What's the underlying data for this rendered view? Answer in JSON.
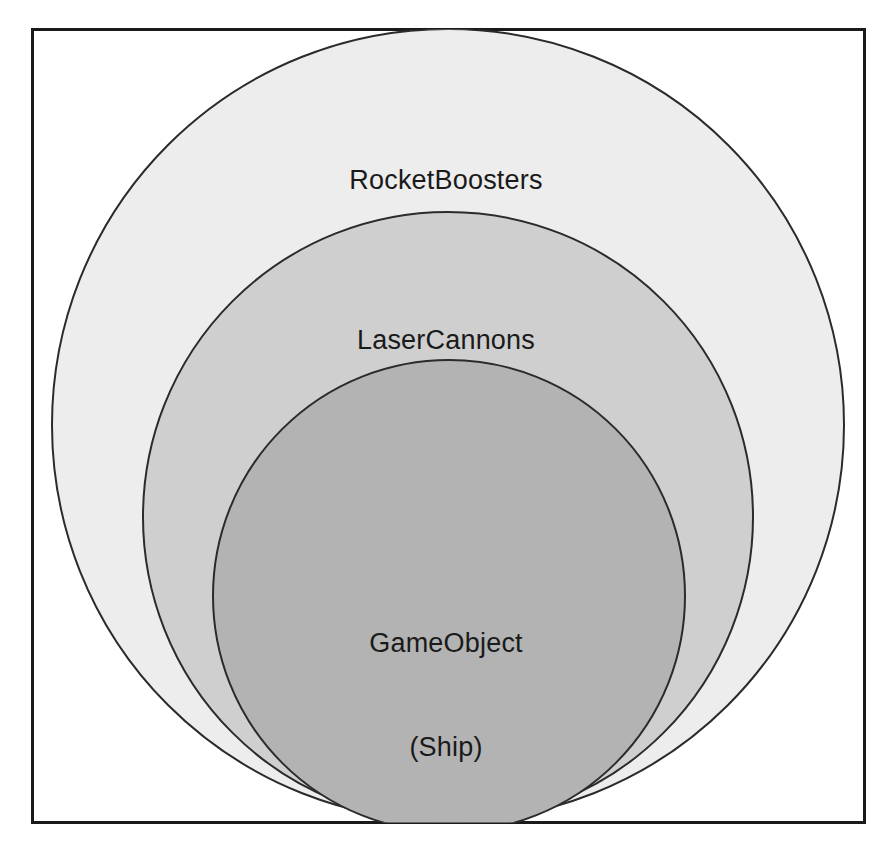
{
  "diagram": {
    "type": "nested-set-diagram",
    "title": "",
    "background_color": "#ffffff",
    "frame": {
      "name": "outer-frame",
      "stroke_color": "#1a1a1a",
      "fill_color": "#ffffff",
      "stroke_width": 3,
      "x": 31,
      "y": 28,
      "width": 835,
      "height": 796
    },
    "circles": [
      {
        "id": "rocketboosters",
        "label": "RocketBoosters",
        "fill_color": "#ededed",
        "stroke_color": "#2b2b2b",
        "stroke_width": 2,
        "cx": 448,
        "cy": 425,
        "r": 396,
        "layer": 1
      },
      {
        "id": "lasercannons",
        "label": "LaserCannons",
        "fill_color": "#cfcfcf",
        "stroke_color": "#2b2b2b",
        "stroke_width": 2,
        "cx": 448,
        "cy": 517,
        "r": 305,
        "layer": 2
      },
      {
        "id": "gameobject",
        "label": "GameObject\n(Ship)",
        "label_line1": "GameObject",
        "label_line2": "(Ship)",
        "fill_color": "#b3b3b3",
        "stroke_color": "#2b2b2b",
        "stroke_width": 2,
        "cx": 449,
        "cy": 596,
        "r": 236,
        "layer": 3
      }
    ],
    "labels": {
      "outer": "RocketBoosters",
      "middle": "LaserCannons",
      "inner_line1": "GameObject",
      "inner_line2": "(Ship)"
    }
  }
}
